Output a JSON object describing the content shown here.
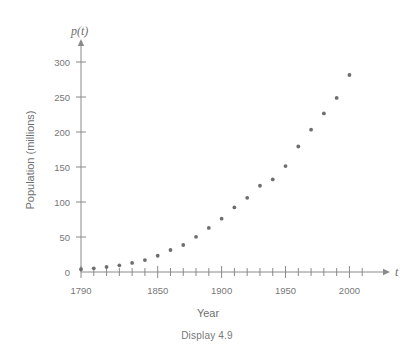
{
  "caption": "Display 4.9",
  "chart_data": {
    "type": "scatter",
    "title": "",
    "xlabel": "Year",
    "ylabel": "Population (millions)",
    "x_axis_symbol": "t",
    "y_axis_symbol": "p(t)",
    "xlim": [
      1790,
      2020
    ],
    "ylim": [
      0,
      320
    ],
    "x_tick_labels": [
      "1790",
      "1850",
      "1900",
      "1950",
      "2000"
    ],
    "x_tick_label_values": [
      1790,
      1850,
      1900,
      1950,
      2000
    ],
    "x_minor_tick_step": 10,
    "y_tick_labels": [
      "0",
      "50",
      "100",
      "150",
      "200",
      "250",
      "300"
    ],
    "y_tick_values": [
      0,
      50,
      100,
      150,
      200,
      250,
      300
    ],
    "grid": false,
    "legend": false,
    "x": [
      1790,
      1800,
      1810,
      1820,
      1830,
      1840,
      1850,
      1860,
      1870,
      1880,
      1890,
      1900,
      1910,
      1920,
      1930,
      1940,
      1950,
      1960,
      1970,
      1980,
      1990,
      2000
    ],
    "values": [
      3.9,
      5.3,
      7.2,
      9.6,
      12.9,
      17.1,
      23.2,
      31.4,
      38.6,
      50.2,
      63.0,
      76.2,
      92.2,
      106.0,
      123.2,
      132.2,
      151.3,
      179.3,
      203.3,
      226.5,
      248.7,
      281.4
    ]
  }
}
